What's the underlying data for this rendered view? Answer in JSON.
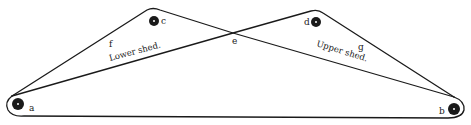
{
  "diagram": {
    "type": "shed-diagram",
    "stroke_color": "#1a1a1a",
    "background": "#ffffff",
    "pulleys": [
      {
        "id": "a",
        "label": "a",
        "cx": 18,
        "cy": 104,
        "r": 6
      },
      {
        "id": "b",
        "label": "b",
        "cx": 454,
        "cy": 109,
        "r": 6
      },
      {
        "id": "c",
        "label": "c",
        "cx": 154,
        "cy": 21,
        "r": 5
      },
      {
        "id": "d",
        "label": "d",
        "cx": 316,
        "cy": 22,
        "r": 5
      }
    ],
    "points": {
      "e": {
        "label": "e",
        "x": 233,
        "y": 33
      },
      "f": {
        "label": "f"
      },
      "g": {
        "label": "g"
      }
    },
    "captions": {
      "lower_shed": "Lower shed.",
      "upper_shed": "Upper shed."
    }
  }
}
